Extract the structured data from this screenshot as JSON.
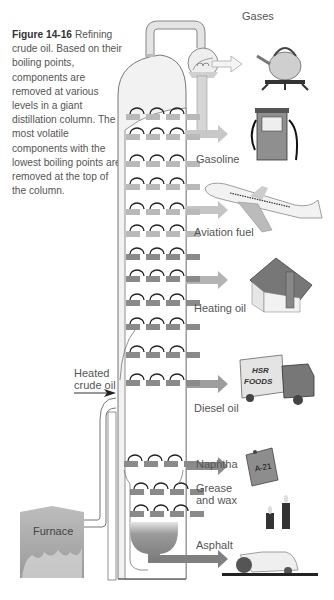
{
  "figure": {
    "number": "Figure 14-16",
    "caption": "Refining crude oil. Based on their boiling points, components are removed at various levels in a giant distillation column. The most volatile components with the lowest boiling points are removed at the top of the column."
  },
  "input": {
    "label_line1": "Heated",
    "label_line2": "crude oil",
    "source": "Furnace"
  },
  "products": [
    {
      "name": "Gases",
      "use_icon": "kettle-on-stove-icon"
    },
    {
      "name": "Gasoline",
      "use_icon": "gas-pump-icon"
    },
    {
      "name": "Aviation fuel",
      "use_icon": "airplane-icon"
    },
    {
      "name": "Heating oil",
      "use_icon": "house-icon"
    },
    {
      "name": "Diesel oil",
      "use_icon": "truck-icon",
      "icon_text_line1": "HSR",
      "icon_text_line2": "FOODS"
    },
    {
      "name": "Naphtha",
      "use_icon": "fuel-can-icon",
      "icon_text": "A-21"
    },
    {
      "name_line1": "Grease",
      "name_line2": "and wax",
      "use_icon": "candles-icon"
    },
    {
      "name": "Asphalt",
      "use_icon": "road-roller-icon"
    }
  ],
  "colors": {
    "column_fill": "#f0f0f0",
    "pipe_fill": "#d9d9d9",
    "tray_upper": "#b9b9b9",
    "tray_lower": "#8a8a8a",
    "arrow_upper": "#c4c4c4",
    "arrow_lower": "#8c8c8c",
    "outline": "#777777"
  }
}
